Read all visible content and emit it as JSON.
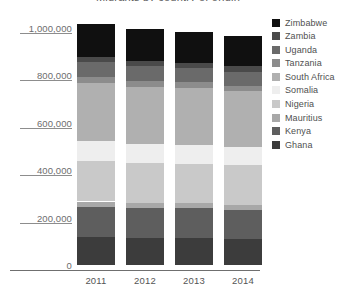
{
  "chart_data": {
    "type": "bar",
    "stacked": true,
    "title": "Migrants by country of origin",
    "xlabel": "",
    "ylabel": "",
    "categories": [
      "2011",
      "2012",
      "2013",
      "2014"
    ],
    "ylim": [
      0,
      1000000
    ],
    "ytick_values": [
      0,
      200000,
      400000,
      600000,
      800000,
      1000000
    ],
    "ytick_labels": [
      "0",
      "200,000",
      "400,000",
      "600,000",
      "800,000",
      "1,000,000"
    ],
    "grid": false,
    "legend_position": "right",
    "series": [
      {
        "name": "Ghana",
        "color": "#3c3c3c",
        "values": [
          118000,
          115000,
          113000,
          110000
        ]
      },
      {
        "name": "Kenya",
        "color": "#5e5e5e",
        "values": [
          128000,
          126000,
          126000,
          124000
        ]
      },
      {
        "name": "Mauritius",
        "color": "#a8a8a8",
        "values": [
          22000,
          21000,
          21000,
          20000
        ]
      },
      {
        "name": "Nigeria",
        "color": "#c9c9c9",
        "values": [
          172000,
          170000,
          168000,
          166000
        ]
      },
      {
        "name": "Somalia",
        "color": "#eeeeee",
        "values": [
          82000,
          80000,
          80000,
          79000
        ]
      },
      {
        "name": "South Africa",
        "color": "#b0b0b0",
        "values": [
          245000,
          241000,
          238000,
          234000
        ]
      },
      {
        "name": "Tanzania",
        "color": "#8c8c8c",
        "values": [
          26000,
          25000,
          25000,
          24000
        ]
      },
      {
        "name": "Uganda",
        "color": "#6a6a6a",
        "values": [
          62000,
          61000,
          60000,
          59000
        ]
      },
      {
        "name": "Zambia",
        "color": "#4a4a4a",
        "values": [
          24000,
          23000,
          23000,
          22000
        ]
      },
      {
        "name": "Zimbabwe",
        "color": "#101010",
        "values": [
          138000,
          134000,
          131000,
          128000
        ]
      }
    ],
    "legend_order": [
      "Zimbabwe",
      "Zambia",
      "Uganda",
      "Tanzania",
      "South Africa",
      "Somalia",
      "Nigeria",
      "Mauritius",
      "Kenya",
      "Ghana"
    ]
  }
}
